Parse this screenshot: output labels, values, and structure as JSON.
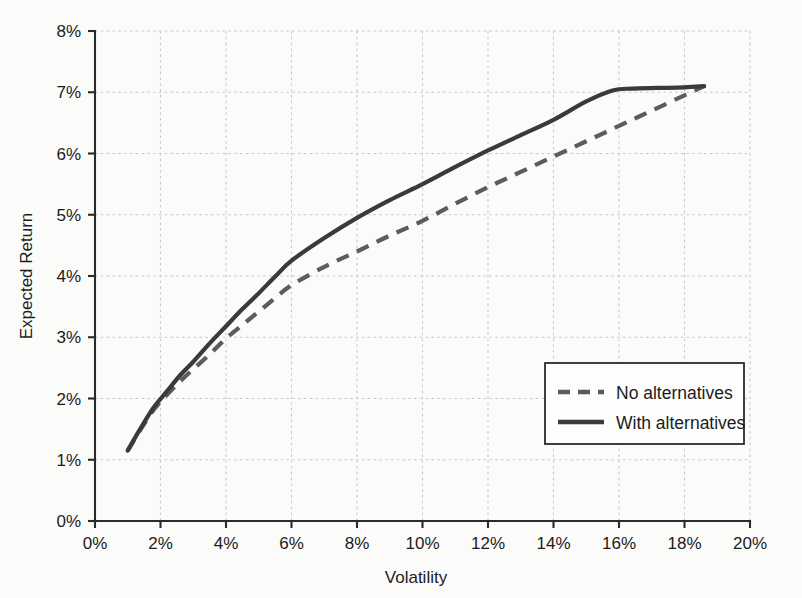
{
  "chart_data": {
    "type": "line",
    "title": "",
    "xlabel": "Volatility",
    "ylabel": "Expected Return",
    "xlim": [
      0,
      20
    ],
    "ylim": [
      0,
      8
    ],
    "xticks": [
      0,
      2,
      4,
      6,
      8,
      10,
      12,
      14,
      16,
      18,
      20
    ],
    "yticks": [
      0,
      1,
      2,
      3,
      4,
      5,
      6,
      7,
      8
    ],
    "xtick_labels": [
      "0%",
      "2%",
      "4%",
      "6%",
      "8%",
      "10%",
      "12%",
      "14%",
      "16%",
      "18%",
      "20%"
    ],
    "ytick_labels": [
      "0%",
      "1%",
      "2%",
      "3%",
      "4%",
      "5%",
      "6%",
      "7%",
      "8%"
    ],
    "grid": true,
    "grid_style": "dotted",
    "legend_position": "lower right",
    "series": [
      {
        "name": "No alternatives",
        "style": "dashed",
        "color": "#5c5c5c",
        "x": [
          1.0,
          1.4,
          1.8,
          2.2,
          2.6,
          3.0,
          3.5,
          4.0,
          4.5,
          5.0,
          5.5,
          6.0,
          7.0,
          8.0,
          9.0,
          10.0,
          11.0,
          12.0,
          13.0,
          14.0,
          15.0,
          16.0,
          17.0,
          18.0,
          18.6
        ],
        "y": [
          1.15,
          1.5,
          1.82,
          2.06,
          2.28,
          2.48,
          2.72,
          2.98,
          3.2,
          3.42,
          3.64,
          3.85,
          4.15,
          4.4,
          4.66,
          4.9,
          5.18,
          5.45,
          5.7,
          5.95,
          6.2,
          6.45,
          6.7,
          6.95,
          7.1
        ]
      },
      {
        "name": "With alternatives",
        "style": "solid",
        "color": "#3a3a3a",
        "x": [
          1.0,
          1.4,
          1.8,
          2.2,
          2.6,
          3.0,
          3.5,
          4.0,
          4.5,
          5.0,
          5.5,
          6.0,
          7.0,
          8.0,
          9.0,
          10.0,
          11.0,
          12.0,
          13.0,
          14.0,
          15.0,
          15.8,
          16.4,
          17.2,
          18.0,
          18.6
        ],
        "y": [
          1.15,
          1.52,
          1.86,
          2.12,
          2.38,
          2.6,
          2.9,
          3.18,
          3.46,
          3.72,
          3.99,
          4.25,
          4.62,
          4.95,
          5.24,
          5.5,
          5.78,
          6.05,
          6.3,
          6.55,
          6.85,
          7.03,
          7.06,
          7.07,
          7.08,
          7.1
        ]
      }
    ],
    "annotations": []
  },
  "legend": {
    "entries": [
      {
        "label": "No alternatives",
        "style": "dashed"
      },
      {
        "label": "With alternatives",
        "style": "solid"
      }
    ]
  },
  "axes": {
    "x_title": "Volatility",
    "y_title": "Expected Return"
  }
}
